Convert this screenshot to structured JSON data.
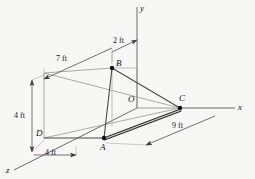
{
  "figure": {
    "type": "engineering-statics-3d-diagram",
    "background_color": "#f7f7f6",
    "line_color": "#4a4a4a",
    "text_color": "#141414",
    "axes": [
      {
        "name": "y-axis",
        "label": "y",
        "direction": "up"
      },
      {
        "name": "x-axis",
        "label": "x",
        "direction": "right"
      },
      {
        "name": "z-axis",
        "label": "z",
        "direction": "lower-left"
      }
    ],
    "points": [
      {
        "id": "A",
        "label": "A",
        "marker": "filled-dot"
      },
      {
        "id": "B",
        "label": "B",
        "marker": "filled-dot"
      },
      {
        "id": "C",
        "label": "C",
        "marker": "filled-dot"
      },
      {
        "id": "D",
        "label": "D",
        "marker": "none"
      },
      {
        "id": "O",
        "label": "O",
        "marker": "none"
      }
    ],
    "dimensions": [
      {
        "id": "dim-2ft",
        "label": "2 ft",
        "orientation": "diagonal-top"
      },
      {
        "id": "dim-7ft",
        "label": "7 ft",
        "orientation": "diagonal-upper-left"
      },
      {
        "id": "dim-4ft-vertical",
        "label": "4 ft",
        "orientation": "vertical-left"
      },
      {
        "id": "dim-4ft-horizontal",
        "label": "4 ft",
        "orientation": "horizontal-bottom"
      },
      {
        "id": "dim-9ft",
        "label": "9 ft",
        "orientation": "diagonal-lower-right"
      }
    ],
    "members": [
      {
        "id": "member-AC",
        "from": "A",
        "to": "C",
        "style": "thick-double-line"
      },
      {
        "id": "member-AB",
        "from": "A",
        "to": "B",
        "style": "solid"
      },
      {
        "id": "member-BC",
        "from": "B",
        "to": "C",
        "style": "solid"
      },
      {
        "id": "member-AD",
        "from": "A",
        "to": "D",
        "style": "solid"
      }
    ]
  }
}
